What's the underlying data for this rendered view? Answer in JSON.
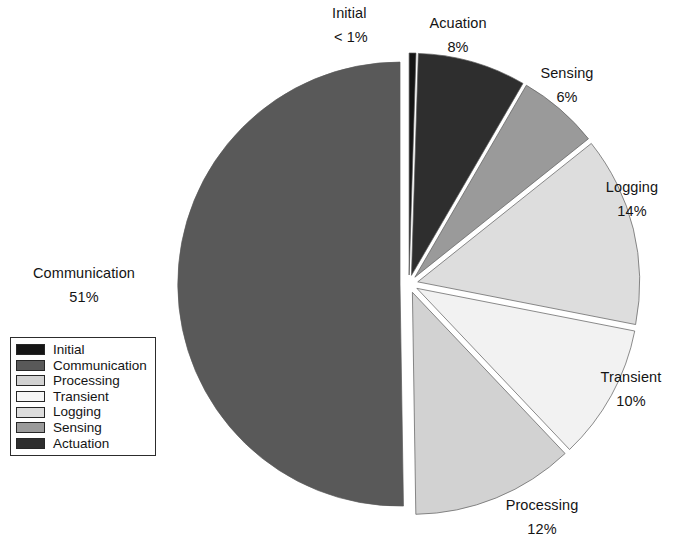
{
  "chart_data": {
    "type": "pie",
    "title": "",
    "exploded": true,
    "start_angle_deg": 0,
    "direction": "clockwise",
    "categories": [
      "Initial",
      "Acuation",
      "Sensing",
      "Logging",
      "Transient",
      "Processing",
      "Communication"
    ],
    "values": [
      0.5,
      8,
      6,
      14,
      10,
      12,
      51
    ],
    "value_labels": [
      "< 1%",
      "8%",
      "6%",
      "14%",
      "10%",
      "12%",
      "51%"
    ],
    "colors": [
      "#151515",
      "#2e2e2e",
      "#9a9a9a",
      "#dddddd",
      "#f2f2f2",
      "#d2d2d2",
      "#595959"
    ],
    "slices": [
      {
        "name": "Initial",
        "value": 0.5,
        "label": "Initial",
        "pct": "< 1%",
        "color": "#151515"
      },
      {
        "name": "Acuation",
        "value": 8,
        "label": "Acuation",
        "pct": "8%",
        "color": "#2e2e2e"
      },
      {
        "name": "Sensing",
        "value": 6,
        "label": "Sensing",
        "pct": "6%",
        "color": "#9a9a9a"
      },
      {
        "name": "Logging",
        "value": 14,
        "label": "Logging",
        "pct": "14%",
        "color": "#dddddd"
      },
      {
        "name": "Transient",
        "value": 10,
        "label": "Transient",
        "pct": "10%",
        "color": "#f2f2f2"
      },
      {
        "name": "Processing",
        "value": 12,
        "label": "Processing",
        "pct": "12%",
        "color": "#d2d2d2"
      },
      {
        "name": "Communication",
        "value": 51,
        "label": "Communication",
        "pct": "51%",
        "color": "#595959"
      }
    ]
  },
  "callouts": {
    "initial": {
      "name": "Initial",
      "pct": "< 1%"
    },
    "actuation": {
      "name": "Acuation",
      "pct": "8%"
    },
    "sensing": {
      "name": "Sensing",
      "pct": "6%"
    },
    "logging": {
      "name": "Logging",
      "pct": "14%"
    },
    "transient": {
      "name": "Transient",
      "pct": "10%"
    },
    "processing": {
      "name": "Processing",
      "pct": "12%"
    },
    "communication": {
      "name": "Communication",
      "pct": "51%"
    }
  },
  "legend": {
    "items": [
      {
        "label": "Initial",
        "color": "#151515"
      },
      {
        "label": "Communication",
        "color": "#595959"
      },
      {
        "label": "Processing",
        "color": "#d2d2d2"
      },
      {
        "label": "Transient",
        "color": "#f7f7f7"
      },
      {
        "label": "Logging",
        "color": "#dddddd"
      },
      {
        "label": "Sensing",
        "color": "#9a9a9a"
      },
      {
        "label": "Actuation",
        "color": "#2e2e2e"
      }
    ]
  }
}
